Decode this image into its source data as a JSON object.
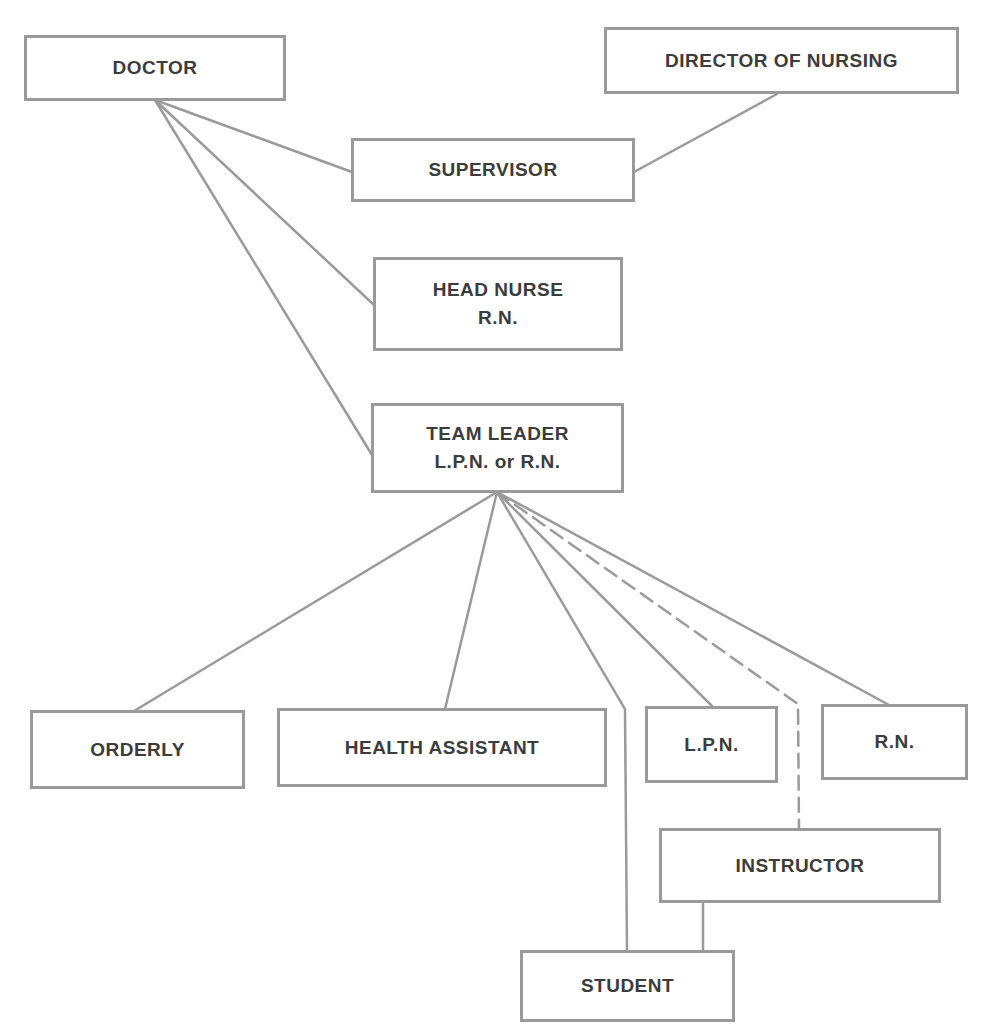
{
  "diagram": {
    "line_color": "#9a9a9a",
    "text_color": "#3c3c3c",
    "nodes": {
      "doctor": {
        "label": "DOCTOR"
      },
      "director": {
        "label": "DIRECTOR OF NURSING"
      },
      "supervisor": {
        "label": "SUPERVISOR"
      },
      "head_nurse": {
        "label": "HEAD NURSE",
        "sublabel": "R.N."
      },
      "team_leader": {
        "label": "TEAM LEADER",
        "sublabel": "L.P.N. or R.N."
      },
      "orderly": {
        "label": "ORDERLY"
      },
      "health_assistant": {
        "label": "HEALTH ASSISTANT"
      },
      "lpn": {
        "label": "L.P.N."
      },
      "rn": {
        "label": "R.N."
      },
      "instructor": {
        "label": "INSTRUCTOR"
      },
      "student": {
        "label": "STUDENT"
      }
    },
    "edges": [
      {
        "from": "DOCTOR",
        "to": "SUPERVISOR",
        "style": "solid"
      },
      {
        "from": "DOCTOR",
        "to": "HEAD NURSE R.N.",
        "style": "solid"
      },
      {
        "from": "DOCTOR",
        "to": "TEAM LEADER L.P.N. or R.N.",
        "style": "solid"
      },
      {
        "from": "DIRECTOR OF NURSING",
        "to": "SUPERVISOR",
        "style": "solid"
      },
      {
        "from": "TEAM LEADER L.P.N. or R.N.",
        "to": "ORDERLY",
        "style": "solid"
      },
      {
        "from": "TEAM LEADER L.P.N. or R.N.",
        "to": "HEALTH ASSISTANT",
        "style": "solid"
      },
      {
        "from": "TEAM LEADER L.P.N. or R.N.",
        "to": "STUDENT",
        "style": "solid"
      },
      {
        "from": "TEAM LEADER L.P.N. or R.N.",
        "to": "L.P.N.",
        "style": "solid"
      },
      {
        "from": "TEAM LEADER L.P.N. or R.N.",
        "to": "INSTRUCTOR",
        "style": "dashed"
      },
      {
        "from": "TEAM LEADER L.P.N. or R.N.",
        "to": "R.N.",
        "style": "solid"
      },
      {
        "from": "INSTRUCTOR",
        "to": "STUDENT",
        "style": "solid"
      }
    ]
  }
}
